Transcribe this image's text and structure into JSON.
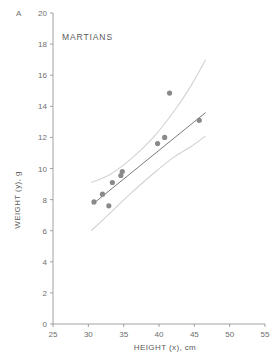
{
  "panel": {
    "label": "A"
  },
  "chart_data": {
    "type": "scatter",
    "title": "MARTIANS",
    "xlabel": "HEIGHT (x), cm",
    "ylabel": "WEIGHT (y), g",
    "xlim": [
      25,
      55
    ],
    "ylim": [
      0,
      20
    ],
    "xticks": [
      25,
      30,
      35,
      40,
      45,
      50,
      55
    ],
    "yticks": [
      0,
      2,
      4,
      6,
      8,
      10,
      12,
      14,
      16,
      18,
      20
    ],
    "grid": false,
    "legend": null,
    "points": [
      {
        "x": 30.8,
        "y": 7.85
      },
      {
        "x": 32.0,
        "y": 8.35
      },
      {
        "x": 32.9,
        "y": 7.6
      },
      {
        "x": 33.4,
        "y": 9.1
      },
      {
        "x": 34.6,
        "y": 9.55
      },
      {
        "x": 34.8,
        "y": 9.8
      },
      {
        "x": 39.8,
        "y": 11.6
      },
      {
        "x": 40.8,
        "y": 12.0
      },
      {
        "x": 41.5,
        "y": 14.85
      },
      {
        "x": 45.7,
        "y": 13.1
      }
    ],
    "fit_line": {
      "name": "least-squares regression",
      "x_start": 30.6,
      "y_start": 7.7,
      "x_end": 46.6,
      "y_end": 13.6
    },
    "confidence_bands": {
      "name": "95% confidence band",
      "upper": [
        {
          "x": 30.4,
          "y": 9.1
        },
        {
          "x": 33.0,
          "y": 9.6
        },
        {
          "x": 36.0,
          "y": 10.6
        },
        {
          "x": 39.0,
          "y": 11.9
        },
        {
          "x": 42.0,
          "y": 13.6
        },
        {
          "x": 44.5,
          "y": 15.3
        },
        {
          "x": 46.6,
          "y": 17.0
        }
      ],
      "lower": [
        {
          "x": 30.4,
          "y": 6.0
        },
        {
          "x": 33.0,
          "y": 7.1
        },
        {
          "x": 36.0,
          "y": 8.4
        },
        {
          "x": 39.0,
          "y": 9.6
        },
        {
          "x": 42.0,
          "y": 10.7
        },
        {
          "x": 44.5,
          "y": 11.4
        },
        {
          "x": 46.6,
          "y": 12.1
        }
      ]
    },
    "marker": {
      "shape": "circle",
      "radius": 2.6,
      "color": "#8a8a8a"
    },
    "colors": {
      "fit_line": "#6b6b6b",
      "band": "#d2d2d2",
      "axis": "#8c8c8c",
      "text": "#5a5a5a"
    }
  }
}
